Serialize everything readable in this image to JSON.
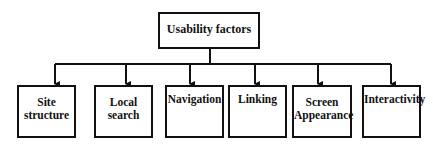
{
  "diagram": {
    "type": "hierarchy",
    "root": {
      "label": "Usability factors"
    },
    "children": [
      {
        "label": "Site structure",
        "lines": [
          "Site",
          "structure"
        ]
      },
      {
        "label": "Local search",
        "lines": [
          "Local",
          "search"
        ]
      },
      {
        "label": "Navigation",
        "lines": [
          "Navigation"
        ]
      },
      {
        "label": "Linking",
        "lines": [
          "Linking"
        ]
      },
      {
        "label": "Screen Appearance",
        "lines": [
          "Screen",
          "Appearance"
        ]
      },
      {
        "label": "Interactivity",
        "lines": [
          "Interactivity"
        ]
      }
    ],
    "colors": {
      "line": "#111111",
      "background": "#ffffff"
    }
  }
}
